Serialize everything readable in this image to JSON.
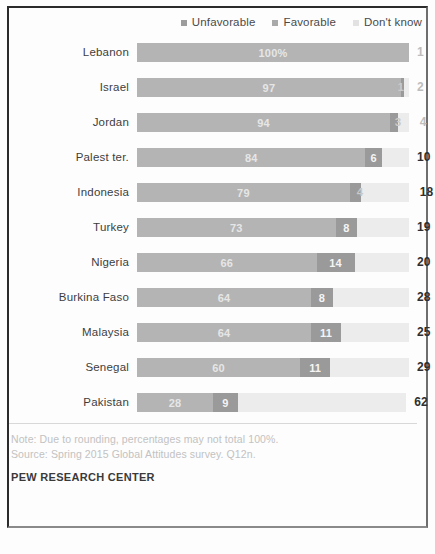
{
  "legend": {
    "items": [
      {
        "label": "Unfavorable",
        "icon": "legend-swatch-unfavorable",
        "color": "#9c9c9c"
      },
      {
        "label": "Favorable",
        "icon": "legend-swatch-favorable",
        "color": "#a9a9a9"
      },
      {
        "label": "Don't know",
        "icon": "legend-swatch-dont-know",
        "color": "#e2e2e2"
      }
    ]
  },
  "footer": {
    "note": "Note: Due to rounding, percentages may not total 100%.",
    "source": "Source: Spring 2015 Global Attitudes survey. Q12n.",
    "brand": "PEW RESEARCH CENTER"
  },
  "chart_data": {
    "type": "bar",
    "title": "",
    "subtitle": "",
    "xlabel": "",
    "ylabel": "",
    "orientation": "horizontal",
    "stacked": true,
    "grid": false,
    "legend_position": "top-right",
    "xlim": [
      0,
      100
    ],
    "unit": "percent",
    "categories": [
      "Lebanon",
      "Israel",
      "Jordan",
      "Palest ter.",
      "Indonesia",
      "Turkey",
      "Nigeria",
      "Burkina Faso",
      "Malaysia",
      "Senegal",
      "Pakistan"
    ],
    "series": [
      {
        "name": "Unfavorable",
        "color": "#b4b4b4",
        "values": [
          100,
          97,
          94,
          84,
          79,
          73,
          66,
          64,
          64,
          60,
          28
        ]
      },
      {
        "name": "Favorable",
        "color": "#9a9a9a",
        "values": [
          0,
          1,
          3,
          6,
          4,
          8,
          14,
          8,
          11,
          11,
          9
        ]
      },
      {
        "name": "Don't know",
        "color": "#ececec",
        "values": [
          0,
          2,
          4,
          10,
          18,
          19,
          20,
          28,
          25,
          29,
          62
        ]
      }
    ],
    "rows": [
      {
        "category": "Lebanon",
        "unfavorable": 100,
        "favorable": 0,
        "dont_know": 0,
        "unfavorable_label": "100%",
        "favorable_label": "",
        "dont_know_label": "1",
        "favorable_label_outside": false,
        "dont_know_faint": true
      },
      {
        "category": "Israel",
        "unfavorable": 97,
        "favorable": 1,
        "dont_know": 2,
        "unfavorable_label": "97",
        "favorable_label": "1",
        "dont_know_label": "2",
        "favorable_label_outside": true,
        "dont_know_faint": true
      },
      {
        "category": "Jordan",
        "unfavorable": 94,
        "favorable": 3,
        "dont_know": 4,
        "unfavorable_label": "94",
        "favorable_label": "3",
        "dont_know_label": "4",
        "favorable_label_outside": true,
        "dont_know_faint": true
      },
      {
        "category": "Palest ter.",
        "unfavorable": 84,
        "favorable": 6,
        "dont_know": 10,
        "unfavorable_label": "84",
        "favorable_label": "6",
        "dont_know_label": "10",
        "favorable_label_outside": false,
        "dont_know_faint": false
      },
      {
        "category": "Indonesia",
        "unfavorable": 79,
        "favorable": 4,
        "dont_know": 18,
        "unfavorable_label": "79",
        "favorable_label": "4",
        "dont_know_label": "18",
        "favorable_label_outside": false,
        "dont_know_faint": false
      },
      {
        "category": "Turkey",
        "unfavorable": 73,
        "favorable": 8,
        "dont_know": 19,
        "unfavorable_label": "73",
        "favorable_label": "8",
        "dont_know_label": "19",
        "favorable_label_outside": false,
        "dont_know_faint": false
      },
      {
        "category": "Nigeria",
        "unfavorable": 66,
        "favorable": 14,
        "dont_know": 20,
        "unfavorable_label": "66",
        "favorable_label": "14",
        "dont_know_label": "20",
        "favorable_label_outside": false,
        "dont_know_faint": false
      },
      {
        "category": "Burkina Faso",
        "unfavorable": 64,
        "favorable": 8,
        "dont_know": 28,
        "unfavorable_label": "64",
        "favorable_label": "8",
        "dont_know_label": "28",
        "favorable_label_outside": false,
        "dont_know_faint": false
      },
      {
        "category": "Malaysia",
        "unfavorable": 64,
        "favorable": 11,
        "dont_know": 25,
        "unfavorable_label": "64",
        "favorable_label": "11",
        "dont_know_label": "25",
        "favorable_label_outside": false,
        "dont_know_faint": false
      },
      {
        "category": "Senegal",
        "unfavorable": 60,
        "favorable": 11,
        "dont_know": 29,
        "unfavorable_label": "60",
        "favorable_label": "11",
        "dont_know_label": "29",
        "favorable_label_outside": false,
        "dont_know_faint": false
      },
      {
        "category": "Pakistan",
        "unfavorable": 28,
        "favorable": 9,
        "dont_know": 62,
        "unfavorable_label": "28",
        "favorable_label": "9",
        "dont_know_label": "62",
        "favorable_label_outside": false,
        "dont_know_faint": false
      }
    ]
  }
}
